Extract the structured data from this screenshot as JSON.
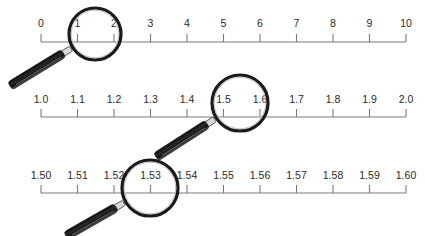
{
  "diagram": {
    "rulers": [
      {
        "name": "ruler-units",
        "labels": [
          "0",
          "1",
          "2",
          "3",
          "4",
          "5",
          "6",
          "7",
          "8",
          "9",
          "10"
        ],
        "baseline_y": 42,
        "label_y": 27,
        "magnifier": {
          "focus_between": [
            "1",
            "2"
          ],
          "cx": 95,
          "cy": 34,
          "r": 26,
          "handle_end": [
            10,
            86
          ]
        }
      },
      {
        "name": "ruler-tenths",
        "labels": [
          "1.0",
          "1.1",
          "1.2",
          "1.3",
          "1.4",
          "1.5",
          "1.6",
          "1.7",
          "1.8",
          "1.9",
          "2.0"
        ],
        "baseline_y": 117,
        "label_y": 103,
        "magnifier": {
          "focus_between": [
            "1.5",
            "1.6"
          ],
          "cx": 240,
          "cy": 103,
          "r": 28,
          "handle_end": [
            156,
            157
          ]
        }
      },
      {
        "name": "ruler-hundredths",
        "labels": [
          "1.50",
          "1.51",
          "1.52",
          "1.53",
          "1.54",
          "1.55",
          "1.56",
          "1.57",
          "1.58",
          "1.59",
          "1.60"
        ],
        "baseline_y": 193,
        "label_y": 179,
        "magnifier": {
          "focus_between": [
            "1.52",
            "1.54"
          ],
          "cx": 150,
          "cy": 188,
          "r": 28,
          "handle_end": [
            66,
            236
          ]
        }
      }
    ],
    "x_start": 41,
    "x_end": 406,
    "colors": {
      "line": "#7a7a7a",
      "text": "#2a2a2a",
      "lens_rim": "#1a1a1a",
      "handle": "#1c1c1c",
      "handle_highlight": "#8a8a8a",
      "ferrule": "#d8d8d8"
    }
  }
}
